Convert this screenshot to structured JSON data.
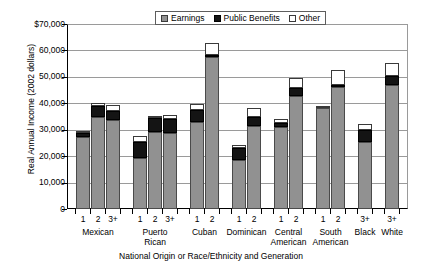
{
  "chart_data": {
    "type": "bar",
    "subtype": "stacked-grouped",
    "title": "",
    "xlabel": "National Origin or Race/Ethnicity and Generation",
    "ylabel": "Real Annual Income (2002 dollars)",
    "ylim": [
      0,
      70000
    ],
    "ytick_labels": [
      "$70,000",
      "60,000",
      "50,000",
      "40,000",
      "30,000",
      "20,000",
      "10,000",
      "0"
    ],
    "ytick_values": [
      70000,
      60000,
      50000,
      40000,
      30000,
      20000,
      10000,
      0
    ],
    "grid": true,
    "legend_position": "top-center",
    "legend": [
      "Earnings",
      "Public Benefits",
      "Other"
    ],
    "series": [
      {
        "name": "Earnings",
        "color": "#919191"
      },
      {
        "name": "Public Benefits",
        "color": "#141414"
      },
      {
        "name": "Other",
        "color": "#ffffff"
      }
    ],
    "groups": [
      {
        "group": "Mexican",
        "bars": [
          {
            "generation": "1",
            "earnings": 27200,
            "public_benefits": 1700,
            "other": 700,
            "total": 29600
          },
          {
            "generation": "2",
            "earnings": 34900,
            "public_benefits": 4000,
            "other": 1400,
            "total": 40300
          },
          {
            "generation": "3+",
            "earnings": 33700,
            "public_benefits": 3500,
            "other": 2100,
            "total": 39300
          }
        ]
      },
      {
        "group": "Puerto Rican",
        "bars": [
          {
            "generation": "1",
            "earnings": 19200,
            "public_benefits": 6200,
            "other": 2300,
            "total": 27700
          },
          {
            "generation": "2",
            "earnings": 29000,
            "public_benefits": 5300,
            "other": 1000,
            "total": 35300
          },
          {
            "generation": "3+",
            "earnings": 28900,
            "public_benefits": 5000,
            "other": 1800,
            "total": 35700
          }
        ]
      },
      {
        "group": "Cuban",
        "bars": [
          {
            "generation": "1",
            "earnings": 32900,
            "public_benefits": 4500,
            "other": 2500,
            "total": 39900
          },
          {
            "generation": "2",
            "earnings": 57400,
            "public_benefits": 900,
            "other": 4700,
            "total": 63000
          }
        ]
      },
      {
        "group": "Dominican",
        "bars": [
          {
            "generation": "1",
            "earnings": 18700,
            "public_benefits": 4500,
            "other": 1000,
            "total": 24200
          },
          {
            "generation": "2",
            "earnings": 31300,
            "public_benefits": 3400,
            "other": 3700,
            "total": 38400
          }
        ]
      },
      {
        "group": "Central American",
        "bars": [
          {
            "generation": "1",
            "earnings": 31000,
            "public_benefits": 1500,
            "other": 1600,
            "total": 34100
          },
          {
            "generation": "2",
            "earnings": 42800,
            "public_benefits": 3000,
            "other": 3700,
            "total": 49500
          }
        ]
      },
      {
        "group": "South American",
        "bars": [
          {
            "generation": "1",
            "earnings": 38400,
            "public_benefits": 0,
            "other": 200,
            "total": 38600
          },
          {
            "generation": "2",
            "earnings": 46300,
            "public_benefits": 700,
            "other": 5500,
            "total": 52500
          }
        ]
      },
      {
        "group": "Black",
        "bars": [
          {
            "generation": "3+",
            "earnings": 25300,
            "public_benefits": 4500,
            "other": 2500,
            "total": 32300
          }
        ]
      },
      {
        "group": "White",
        "bars": [
          {
            "generation": "3+",
            "earnings": 47000,
            "public_benefits": 3500,
            "other": 4800,
            "total": 55300
          }
        ]
      }
    ]
  }
}
